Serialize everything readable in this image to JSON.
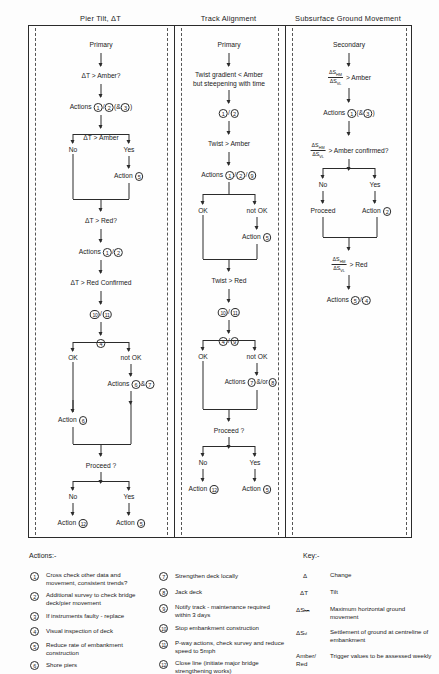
{
  "columns": [
    {
      "header": "Pier Tilt, ΔT",
      "tier": "Primary"
    },
    {
      "header": "Track Alignment",
      "tier": "Primary"
    },
    {
      "header": "Subsurface Ground Movement",
      "tier": "Secondary"
    }
  ],
  "pier_tilt": {
    "q1": "ΔT > Amber?",
    "actions1_label": "Actions",
    "actions1_nums": [
      "1",
      "2",
      "3"
    ],
    "decision1": "ΔT > Amber",
    "no": "No",
    "yes": "Yes",
    "action_yes_label": "Action",
    "action_yes_num": "5",
    "q2": "ΔT > Red?",
    "actions2_label": "Actions",
    "actions2_nums": [
      "1",
      "2"
    ],
    "q3": "ΔT > Red Confirmed",
    "nums3": [
      "10",
      "11"
    ],
    "decision2_num": "4",
    "ok": "OK",
    "not_ok": "not OK",
    "actions3_label": "Actions",
    "actions3_nums": [
      "6",
      "7"
    ],
    "action4_label": "Action",
    "action4_num": "6",
    "proceed": "Proceed ?",
    "final_no_label": "Action",
    "final_no_num": "12",
    "final_yes_label": "Action",
    "final_yes_num": "5"
  },
  "track_alignment": {
    "q1_line1": "Twist gradient < Amber",
    "q1_line2": "but steepening with time",
    "nums1": [
      "1",
      "2"
    ],
    "q2": "Twist > Amber",
    "actions1_label": "Actions",
    "actions1_nums": [
      "1",
      "2",
      "9"
    ],
    "ok": "OK",
    "not_ok": "not OK",
    "action_notok_label": "Action",
    "action_notok_num": "5",
    "q3": "Twist > Red",
    "nums2": [
      "10",
      "11"
    ],
    "decision_nums": [
      "4",
      "9"
    ],
    "actions2_label": "Actions",
    "actions2_nums": [
      "7",
      "8"
    ],
    "actions2_join": "&/or",
    "proceed": "Proceed ?",
    "no": "No",
    "yes": "Yes",
    "final_no_label": "Action",
    "final_no_num": "12",
    "final_yes_label": "Action",
    "final_yes_num": "5"
  },
  "ground_movement": {
    "frac_num": "ΔS",
    "frac_num_sub": "HM",
    "frac_den": "ΔS",
    "frac_den_sub": "VL",
    "q1_tail": "> Amber",
    "actions1_label": "Actions",
    "actions1_nums": [
      "1",
      "3"
    ],
    "q2_tail": "> Amber confirmed?",
    "no": "No",
    "yes": "Yes",
    "proceed": "Proceed",
    "action_yes_label": "Action",
    "action_yes_num": "2",
    "q3_tail": "> Red",
    "actions2_label": "Actions",
    "actions2_nums": [
      "5",
      "4"
    ]
  },
  "legend": {
    "actions_title": "Actions:-",
    "key_title": "Key:-",
    "actions": [
      {
        "num": "1",
        "text": "Cross check other data and movement, consistent trends?"
      },
      {
        "num": "2",
        "text": "Additional survey to check bridge deck/pier movement"
      },
      {
        "num": "3",
        "text": "If instruments faulty - replace"
      },
      {
        "num": "4",
        "text": "Visual inspection of deck"
      },
      {
        "num": "5",
        "text": "Reduce rate of embankment construction"
      },
      {
        "num": "6",
        "text": "Shore piers"
      },
      {
        "num": "7",
        "text": "Strengthen deck locally"
      },
      {
        "num": "8",
        "text": "Jack deck"
      },
      {
        "num": "9",
        "text": "Notify track - maintenance required within 3 days"
      },
      {
        "num": "10",
        "text": "Stop embankment construction"
      },
      {
        "num": "11",
        "text": "P-way actions, check survey and reduce speed to 5mph"
      },
      {
        "num": "12",
        "text": "Close line (initiate major bridge strengthening works)"
      }
    ],
    "key": [
      {
        "symbol": "Δ",
        "definition": "Change"
      },
      {
        "symbol": "ΔT",
        "definition": "Tilt"
      },
      {
        "symbol": "ΔSₕₘ",
        "definition": "Maximum horizontal ground movement"
      },
      {
        "symbol": "ΔSᵥₗ",
        "definition": "Settlement of ground at centreline of embankment"
      },
      {
        "symbol": "Amber/ Red",
        "definition": "Trigger values to be assessed weekly"
      }
    ]
  }
}
